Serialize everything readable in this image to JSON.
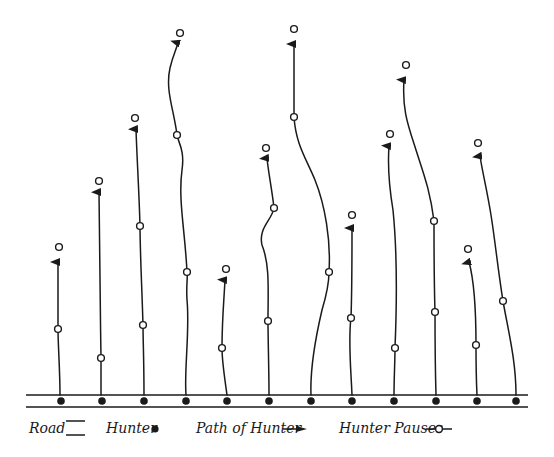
{
  "diagram": {
    "road": {
      "x1": 26,
      "x2": 528,
      "y_top": 395,
      "y_bottom": 407,
      "color": "#1a1a1a"
    },
    "hunters": [
      {
        "id": 1,
        "start": [
          61,
          401
        ],
        "path": "M60,395 C60,370 58,345 58,329 C58,300 58,275 58,262",
        "pauses": [
          [
            58,
            329
          ]
        ],
        "arrow_tip": [
          58,
          256
        ],
        "end_pause": [
          59,
          247
        ]
      },
      {
        "id": 2,
        "start": [
          102,
          401
        ],
        "path": "M101,395 C101,380 101,365 101,358 C100,300 100,240 99,192",
        "pauses": [
          [
            101,
            358
          ]
        ],
        "arrow_tip": [
          99,
          186
        ],
        "end_pause": [
          99,
          181
        ]
      },
      {
        "id": 3,
        "start": [
          144,
          401
        ],
        "path": "M144,395 C144,360 143,340 143,325 C142,290 140,250 140,226 C139,190 137,160 136,129",
        "pauses": [
          [
            143,
            325
          ],
          [
            140,
            226
          ]
        ],
        "arrow_tip": [
          136,
          123
        ],
        "end_pause": [
          135,
          118
        ]
      },
      {
        "id": 4,
        "start": [
          186,
          401
        ],
        "path": "M186,395 C184,370 190,330 187,300 C186,285 188,278 187,272 C185,230 178,200 182,170 C185,150 178,142 177,135 C174,110 165,90 170,68 C173,55 176,50 178,43",
        "pauses": [
          [
            187,
            272
          ],
          [
            177,
            135
          ]
        ],
        "arrow_tip": [
          178,
          40
        ],
        "end_pause": [
          180,
          33
        ]
      },
      {
        "id": 5,
        "start": [
          227,
          401
        ],
        "path": "M227,395 C225,380 222,362 222,348 C222,320 224,300 225,280",
        "pauses": [
          [
            222,
            348
          ]
        ],
        "arrow_tip": [
          225,
          275
        ],
        "end_pause": [
          226,
          269
        ]
      },
      {
        "id": 6,
        "start": [
          269,
          401
        ],
        "path": "M269,395 C269,370 268,340 268,321 C268,290 270,265 262,245 C258,228 272,220 274,208 C272,190 268,170 267,158",
        "pauses": [
          [
            268,
            321
          ],
          [
            274,
            208
          ]
        ],
        "arrow_tip": [
          267,
          155
        ],
        "end_pause": [
          266,
          148
        ]
      },
      {
        "id": 7,
        "start": [
          311,
          401
        ],
        "path": "M311,395 C310,370 315,340 322,310 C328,290 329,280 329,272 C331,240 325,205 315,180 C306,158 296,145 294,117 C294,90 294,60 294,44",
        "pauses": [
          [
            329,
            272
          ],
          [
            294,
            117
          ]
        ],
        "arrow_tip": [
          294,
          38
        ],
        "end_pause": [
          294,
          29
        ]
      },
      {
        "id": 8,
        "start": [
          352,
          401
        ],
        "path": "M352,395 C351,370 348,340 351,318 C352,290 352,250 352,228",
        "pauses": [
          [
            351,
            318
          ]
        ],
        "arrow_tip": [
          352,
          222
        ],
        "end_pause": [
          352,
          215
        ]
      },
      {
        "id": 9,
        "start": [
          394,
          401
        ],
        "path": "M394,395 C394,380 395,360 395,348 C397,300 397,250 393,210 C388,180 388,160 389,146",
        "pauses": [
          [
            395,
            348
          ]
        ],
        "arrow_tip": [
          389,
          140
        ],
        "end_pause": [
          390,
          134
        ]
      },
      {
        "id": 10,
        "start": [
          436,
          401
        ],
        "path": "M436,395 C435,360 435,330 435,312 C434,280 434,245 434,221 C430,190 424,175 416,150 C408,125 402,110 404,80",
        "pauses": [
          [
            435,
            312
          ],
          [
            434,
            221
          ]
        ],
        "arrow_tip": [
          405,
          73
        ],
        "end_pause": [
          406,
          65
        ]
      },
      {
        "id": 11,
        "start": [
          477,
          401
        ],
        "path": "M477,395 C476,375 476,355 476,345 C476,310 474,280 469,262",
        "pauses": [
          [
            476,
            345
          ]
        ],
        "arrow_tip": [
          469,
          256
        ],
        "end_pause": [
          468,
          249
        ]
      },
      {
        "id": 12,
        "start": [
          516,
          401
        ],
        "path": "M516,395 C516,360 508,330 503,301 C498,270 495,240 491,215 C487,190 482,170 480,156",
        "pauses": [
          [
            503,
            301
          ]
        ],
        "arrow_tip": [
          479,
          150
        ],
        "end_pause": [
          478,
          143
        ]
      }
    ]
  },
  "legend": {
    "road_label": "Road",
    "hunter_label": "Hunter",
    "path_label": "Path of Hunter",
    "pauses_label": "Hunter Pauses"
  }
}
